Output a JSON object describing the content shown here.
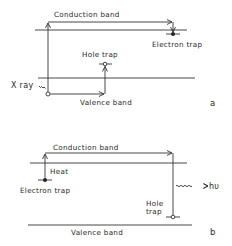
{
  "panels": [
    {
      "id": "a",
      "label": "a",
      "conduction_band": "Conduction band",
      "valence_band": "Valence band",
      "electron_trap": "Electron trap",
      "hole_trap": "Hole trap",
      "excitation": "X ray"
    },
    {
      "id": "b",
      "label": "b",
      "conduction_band": "Conduction band",
      "valence_band": "Valence band",
      "electron_trap": "Electron trap",
      "hole_trap_line1": "Hole",
      "hole_trap_line2": "trap",
      "heat": "Heat",
      "emission": "hυ"
    }
  ],
  "colors": {
    "ink": "#333333",
    "background": "#ffffff"
  }
}
